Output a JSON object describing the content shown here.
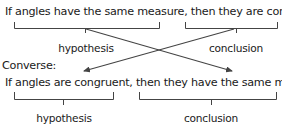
{
  "statement": {
    "text": "If angles have the same measure, then they are congruent.",
    "hypothesis_label": "hypothesis",
    "conclusion_label": "conclusion"
  },
  "converse": {
    "heading": "Converse:",
    "text": "If angles are congruent, then they have the same measure.",
    "hypothesis_label": "hypothesis",
    "conclusion_label": "conclusion"
  },
  "colors": {
    "text": "#1a1a1a",
    "lines": "#444444"
  }
}
